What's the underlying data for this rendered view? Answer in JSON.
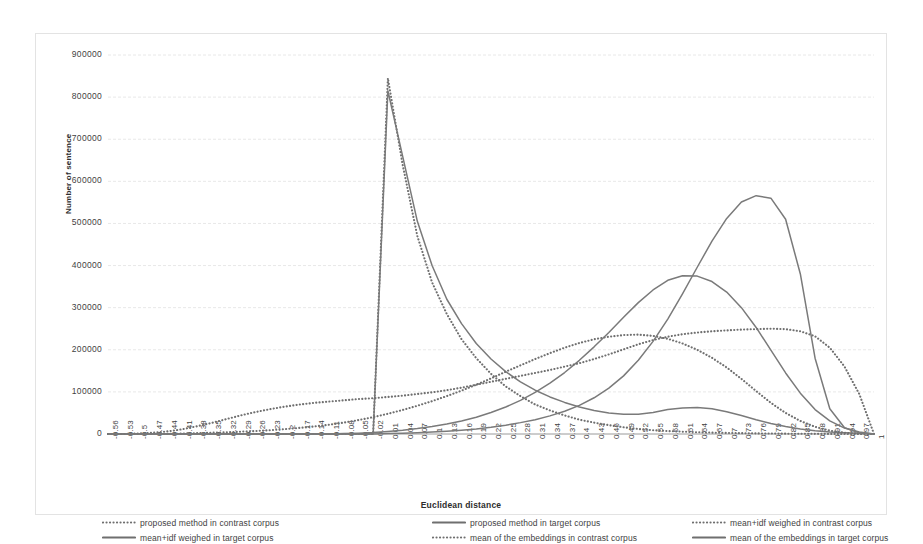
{
  "chart_data": {
    "type": "line",
    "title": "",
    "xlabel": "Euclidean distance",
    "ylabel": "Number of sentence",
    "ylim": [
      0,
      900000
    ],
    "ytick_step": 100000,
    "yticks": [
      "0",
      "100000",
      "200000",
      "300000",
      "400000",
      "500000",
      "600000",
      "700000",
      "800000",
      "900000"
    ],
    "grid": true,
    "legend_position": "bottom",
    "xticks": [
      "-0.56",
      "-0.53",
      "-0.5",
      "-0.47",
      "-0.44",
      "-0.41",
      "-0.38",
      "-0.35",
      "-0.32",
      "-0.29",
      "-0.26",
      "-0.23",
      "-0.2",
      "-0.17",
      "-0.14",
      "-0.11",
      "-0.08",
      "-0.05",
      "-0.02",
      "0.01",
      "0.04",
      "0.07",
      "0.1",
      "0.13",
      "0.16",
      "0.19",
      "0.22",
      "0.25",
      "0.28",
      "0.31",
      "0.34",
      "0.37",
      "0.4",
      "0.43",
      "0.46",
      "0.49",
      "0.52",
      "0.55",
      "0.58",
      "0.61",
      "0.64",
      "0.67",
      "0.7",
      "0.73",
      "0.76",
      "0.79",
      "0.82",
      "0.85",
      "0.88",
      "0.91",
      "0.94",
      "0.97",
      "1"
    ],
    "x": [
      -0.56,
      -0.53,
      -0.5,
      -0.47,
      -0.44,
      -0.41,
      -0.38,
      -0.35,
      -0.32,
      -0.29,
      -0.26,
      -0.23,
      -0.2,
      -0.17,
      -0.14,
      -0.11,
      -0.08,
      -0.05,
      -0.02,
      0.01,
      0.04,
      0.07,
      0.1,
      0.13,
      0.16,
      0.19,
      0.22,
      0.25,
      0.28,
      0.31,
      0.34,
      0.37,
      0.4,
      0.43,
      0.46,
      0.49,
      0.52,
      0.55,
      0.58,
      0.61,
      0.64,
      0.67,
      0.7,
      0.73,
      0.76,
      0.79,
      0.82,
      0.85,
      0.88,
      0.91,
      0.94,
      0.97,
      1
    ],
    "series": [
      {
        "name": "proposed method in contrast corpus",
        "style": "dotted",
        "color": "#6f6f6f",
        "values": [
          0,
          0,
          0,
          0,
          0,
          0,
          0,
          0,
          0,
          0,
          0,
          0,
          0,
          0,
          0,
          0,
          0,
          0,
          0,
          845000,
          640000,
          470000,
          360000,
          285000,
          225000,
          180000,
          143000,
          113000,
          90000,
          70000,
          56000,
          44000,
          34000,
          27000,
          21000,
          16000,
          12000,
          9000,
          7000,
          5500,
          4200,
          3300,
          2600,
          2000,
          1500,
          1100,
          800,
          600,
          400,
          250,
          120,
          40,
          0
        ]
      },
      {
        "name": "proposed method in target corpus",
        "style": "solid",
        "color": "#7a7a7a",
        "values": [
          0,
          0,
          0,
          0,
          0,
          0,
          0,
          0,
          0,
          0,
          0,
          0,
          0,
          0,
          0,
          0,
          0,
          0,
          0,
          815000,
          660000,
          505000,
          400000,
          320000,
          262000,
          215000,
          178000,
          148000,
          124000,
          104000,
          88000,
          75000,
          64000,
          56000,
          50000,
          47000,
          47000,
          51000,
          58000,
          62000,
          63000,
          60000,
          53000,
          44000,
          34000,
          25000,
          18000,
          12000,
          8000,
          5000,
          3000,
          1500,
          0
        ]
      },
      {
        "name": "mean+idf weighed in contrast corpus",
        "style": "dotted",
        "color": "#6f6f6f",
        "values": [
          0,
          0,
          0,
          0,
          0,
          1000,
          2000,
          3000,
          4000,
          5500,
          7000,
          9000,
          11500,
          14500,
          18000,
          22000,
          27000,
          33000,
          40000,
          48000,
          57000,
          67000,
          78000,
          90000,
          103000,
          117000,
          132000,
          148000,
          163000,
          178000,
          192000,
          205000,
          216000,
          225000,
          231000,
          235000,
          236000,
          233000,
          226000,
          215000,
          200000,
          181000,
          158000,
          131000,
          102000,
          74000,
          50000,
          31000,
          17000,
          8000,
          3000,
          800,
          0
        ]
      },
      {
        "name": "mean+idf weighed in target corpus",
        "style": "solid",
        "color": "#7a7a7a",
        "values": [
          0,
          0,
          0,
          0,
          0,
          0,
          0,
          0,
          0,
          0,
          0,
          0,
          0,
          0,
          0,
          0,
          1000,
          2000,
          3500,
          6000,
          9000,
          13000,
          18000,
          24000,
          31000,
          40000,
          51000,
          64000,
          80000,
          99000,
          121000,
          146000,
          175000,
          207000,
          241000,
          277000,
          312000,
          342000,
          365000,
          376000,
          375000,
          362000,
          337000,
          300000,
          253000,
          199000,
          145000,
          97000,
          58000,
          31000,
          14000,
          5000,
          0
        ]
      },
      {
        "name": "mean of the embeddings in contrast corpus",
        "style": "dotted",
        "color": "#6f6f6f",
        "values": [
          0,
          0,
          1000,
          3000,
          6000,
          11000,
          18000,
          26000,
          35000,
          44000,
          52000,
          59000,
          65000,
          70000,
          74000,
          77000,
          80000,
          83000,
          85000,
          88000,
          91000,
          95000,
          99000,
          104000,
          110000,
          117000,
          124000,
          131000,
          138000,
          145000,
          152000,
          160000,
          168000,
          178000,
          189000,
          201000,
          213000,
          223000,
          231000,
          237000,
          241000,
          244000,
          246000,
          248000,
          249000,
          250000,
          249000,
          244000,
          232000,
          205000,
          160000,
          95000,
          0
        ]
      },
      {
        "name": "mean of the embeddings in target corpus",
        "style": "solid",
        "color": "#7a7a7a",
        "values": [
          0,
          0,
          0,
          0,
          0,
          0,
          0,
          0,
          0,
          0,
          0,
          0,
          0,
          0,
          0,
          0,
          0,
          0,
          0,
          1000,
          2000,
          3000,
          4500,
          6500,
          9000,
          12000,
          16000,
          21000,
          27000,
          34000,
          43000,
          54000,
          68000,
          86000,
          109000,
          138000,
          175000,
          220000,
          273000,
          333000,
          396000,
          458000,
          512000,
          551000,
          566000,
          560000,
          510000,
          380000,
          180000,
          60000,
          15000,
          3000,
          0
        ]
      }
    ]
  },
  "axes": {
    "ylabels": [
      "900000",
      "800000",
      "700000",
      "600000",
      "500000",
      "400000",
      "300000",
      "200000",
      "100000",
      "0"
    ],
    "ytitle": "Number of sentence",
    "xtitle": "Euclidean distance"
  },
  "legend": {
    "items": [
      {
        "label": "proposed method in contrast corpus",
        "style": "dotted"
      },
      {
        "label": "proposed method in target corpus",
        "style": "solid"
      },
      {
        "label": "mean+idf weighed in contrast corpus",
        "style": "dotted"
      },
      {
        "label": "mean+idf weighed in target corpus",
        "style": "solid"
      },
      {
        "label": "mean of the embeddings in contrast corpus",
        "style": "dotted"
      },
      {
        "label": "mean of the embeddings in target corpus",
        "style": "solid"
      }
    ]
  }
}
